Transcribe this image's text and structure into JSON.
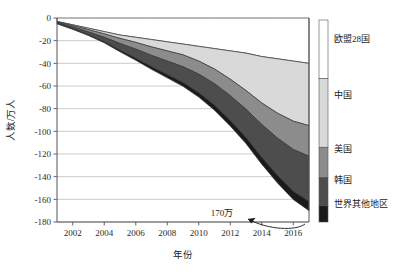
{
  "chart_data": {
    "type": "area",
    "stacked": true,
    "title": "",
    "xlabel": "年份",
    "ylabel": "人数/万人",
    "xlim": [
      2001,
      2017
    ],
    "ylim": [
      -180,
      0
    ],
    "ytick_step": 20,
    "grid": true,
    "legend_position": "right",
    "legend_style": "vertical-color-bar",
    "x": [
      2001,
      2002,
      2003,
      2004,
      2005,
      2006,
      2007,
      2008,
      2009,
      2010,
      2011,
      2012,
      2013,
      2014,
      2015,
      2016,
      2017
    ],
    "xtick_labels": [
      "2002",
      "2004",
      "2006",
      "2008",
      "2010",
      "2012",
      "2014",
      "2016"
    ],
    "xticks": [
      2002,
      2004,
      2006,
      2008,
      2010,
      2012,
      2014,
      2016
    ],
    "ytick_labels": [
      "0",
      "-20",
      "-40",
      "-60",
      "-80",
      "-100",
      "-120",
      "-140",
      "-160",
      "-180"
    ],
    "yticks": [
      0,
      -20,
      -40,
      -60,
      -80,
      -100,
      -120,
      -140,
      -160,
      -180
    ],
    "series": [
      {
        "name": "欧盟28国",
        "color": "#ffffff",
        "values": [
          -3.0,
          -6.0,
          -9.0,
          -12.0,
          -15.0,
          -17.0,
          -19.0,
          -21.0,
          -23.0,
          -25.0,
          -27.0,
          -29.0,
          -31.0,
          -34.0,
          -36.0,
          -38.0,
          -40.0
        ]
      },
      {
        "name": "中国",
        "color": "#d9d9d9",
        "values": [
          -0.4,
          -0.8,
          -1.3,
          -2.0,
          -3.0,
          -4.5,
          -6.5,
          -8.0,
          -9.5,
          -13.0,
          -18.0,
          -25.0,
          -33.0,
          -41.0,
          -48.0,
          -53.0,
          -55.0
        ]
      },
      {
        "name": "美国",
        "color": "#8c8c8c",
        "values": [
          -0.6,
          -1.2,
          -2.0,
          -3.0,
          -4.5,
          -6.0,
          -7.5,
          -9.0,
          -10.5,
          -11.5,
          -13.0,
          -14.5,
          -16.5,
          -19.0,
          -22.0,
          -25.0,
          -27.0
        ]
      },
      {
        "name": "韩国",
        "color": "#4d4d4d",
        "values": [
          -0.8,
          -1.6,
          -2.6,
          -4.0,
          -6.0,
          -8.0,
          -10.0,
          -12.0,
          -14.0,
          -16.5,
          -19.0,
          -22.0,
          -25.0,
          -29.0,
          -33.0,
          -37.0,
          -40.0
        ]
      },
      {
        "name": "世界其他地区",
        "color": "#1a1a1a",
        "values": [
          -0.2,
          -0.4,
          -0.6,
          -0.9,
          -1.3,
          -1.8,
          -2.3,
          -2.8,
          -3.3,
          -3.8,
          -4.3,
          -4.8,
          -5.3,
          -6.0,
          -6.6,
          -7.2,
          -8.0
        ]
      }
    ],
    "annotations": [
      {
        "text": "170万",
        "x": 2012.1,
        "y": -170,
        "arrow_to_x": 2017,
        "arrow_to_y": -170
      }
    ]
  },
  "legend": {
    "items": [
      {
        "label": "欧盟28国",
        "color": "#ffffff"
      },
      {
        "label": "中国",
        "color": "#d9d9d9"
      },
      {
        "label": "美国",
        "color": "#8c8c8c"
      },
      {
        "label": "韩国",
        "color": "#4d4d4d"
      },
      {
        "label": "世界其他地区",
        "color": "#1a1a1a"
      }
    ]
  },
  "axis": {
    "y_title": "人数/万人",
    "x_title": "年份"
  },
  "annotation": {
    "value_label": "170万"
  },
  "colors": {
    "axis": "#555555",
    "grid": "#aaaaaa",
    "outline": "#333333",
    "background": "#ffffff"
  }
}
